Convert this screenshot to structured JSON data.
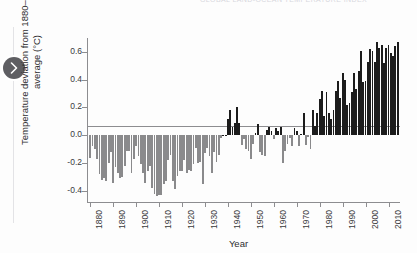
{
  "page": {
    "top_caption": "GLOBAL LAND-OCEAN TEMPERATURE INDEX",
    "background_color": "#fdfdfd"
  },
  "carousel": {
    "next_icon": "chevron-right-icon",
    "button_color": "#5e5e62",
    "rail_color": "#e3e3e6"
  },
  "chart_data": {
    "type": "bar",
    "title": "",
    "xlabel": "Year",
    "ylabel": "Temperature deviation from 1880–2010 average (°C)",
    "ylabel_line1": "Temperature deviation from 1880–2010",
    "ylabel_line2": "average (°C)",
    "xlim": [
      1879,
      2015
    ],
    "ylim": [
      -0.48,
      0.7
    ],
    "ytick_labels": [
      "0.6",
      "0.4",
      "0.2",
      "0.0",
      "-0.2",
      "-0.4"
    ],
    "ytick_values": [
      0.6,
      0.4,
      0.2,
      0.0,
      -0.2,
      -0.4
    ],
    "xtick_labels": [
      "1880",
      "1890",
      "1900",
      "1910",
      "1920",
      "1930",
      "1940",
      "1950",
      "1960",
      "1970",
      "1980",
      "1990",
      "2000",
      "2010"
    ],
    "xtick_values": [
      1880,
      1890,
      1900,
      1910,
      1920,
      1930,
      1940,
      1950,
      1960,
      1970,
      1980,
      1990,
      2000,
      2010
    ],
    "grid": false,
    "legend": "none",
    "positive_color": "#1c1c1c",
    "negative_color": "#8a8a8c",
    "axis_color": "#8d8d90",
    "x": [
      1880,
      1881,
      1882,
      1883,
      1884,
      1885,
      1886,
      1887,
      1888,
      1889,
      1890,
      1891,
      1892,
      1893,
      1894,
      1895,
      1896,
      1897,
      1898,
      1899,
      1900,
      1901,
      1902,
      1903,
      1904,
      1905,
      1906,
      1907,
      1908,
      1909,
      1910,
      1911,
      1912,
      1913,
      1914,
      1915,
      1916,
      1917,
      1918,
      1919,
      1920,
      1921,
      1922,
      1923,
      1924,
      1925,
      1926,
      1927,
      1928,
      1929,
      1930,
      1931,
      1932,
      1933,
      1934,
      1935,
      1936,
      1937,
      1938,
      1939,
      1940,
      1941,
      1942,
      1943,
      1944,
      1945,
      1946,
      1947,
      1948,
      1949,
      1950,
      1951,
      1952,
      1953,
      1954,
      1955,
      1956,
      1957,
      1958,
      1959,
      1960,
      1961,
      1962,
      1963,
      1964,
      1965,
      1966,
      1967,
      1968,
      1969,
      1970,
      1971,
      1972,
      1973,
      1974,
      1975,
      1976,
      1977,
      1978,
      1979,
      1980,
      1981,
      1982,
      1983,
      1984,
      1985,
      1986,
      1987,
      1988,
      1989,
      1990,
      1991,
      1992,
      1993,
      1994,
      1995,
      1996,
      1997,
      1998,
      1999,
      2000,
      2001,
      2002,
      2003,
      2004,
      2005,
      2006,
      2007,
      2008,
      2009,
      2010,
      2011,
      2012,
      2013,
      2014
    ],
    "values": [
      -0.16,
      -0.08,
      -0.1,
      -0.17,
      -0.28,
      -0.32,
      -0.31,
      -0.33,
      -0.2,
      -0.12,
      -0.34,
      -0.23,
      -0.27,
      -0.31,
      -0.3,
      -0.22,
      -0.11,
      -0.11,
      -0.27,
      -0.17,
      -0.08,
      -0.15,
      -0.21,
      -0.27,
      -0.34,
      -0.26,
      -0.22,
      -0.38,
      -0.42,
      -0.44,
      -0.43,
      -0.43,
      -0.35,
      -0.33,
      -0.18,
      -0.14,
      -0.33,
      -0.39,
      -0.29,
      -0.26,
      -0.26,
      -0.18,
      -0.27,
      -0.25,
      -0.26,
      -0.21,
      -0.09,
      -0.2,
      -0.19,
      -0.35,
      -0.13,
      -0.09,
      -0.15,
      -0.27,
      -0.12,
      -0.19,
      -0.14,
      -0.02,
      0.0,
      0.0,
      0.12,
      0.18,
      0.06,
      0.09,
      0.2,
      0.09,
      -0.07,
      -0.03,
      -0.1,
      -0.11,
      -0.17,
      -0.06,
      0.02,
      0.08,
      -0.12,
      -0.14,
      -0.15,
      0.04,
      0.06,
      0.03,
      -0.03,
      0.05,
      0.03,
      0.06,
      -0.2,
      -0.11,
      -0.06,
      -0.02,
      -0.08,
      0.05,
      0.03,
      -0.08,
      0.01,
      0.16,
      -0.07,
      -0.01,
      -0.1,
      0.18,
      0.07,
      0.16,
      0.26,
      0.32,
      0.14,
      0.31,
      0.16,
      0.12,
      0.18,
      0.32,
      0.39,
      0.27,
      0.45,
      0.4,
      0.22,
      0.23,
      0.31,
      0.45,
      0.33,
      0.46,
      0.61,
      0.38,
      0.39,
      0.53,
      0.62,
      0.61,
      0.53,
      0.67,
      0.63,
      0.65,
      0.52,
      0.63,
      0.65,
      0.59,
      0.57,
      0.64,
      0.67
    ]
  }
}
